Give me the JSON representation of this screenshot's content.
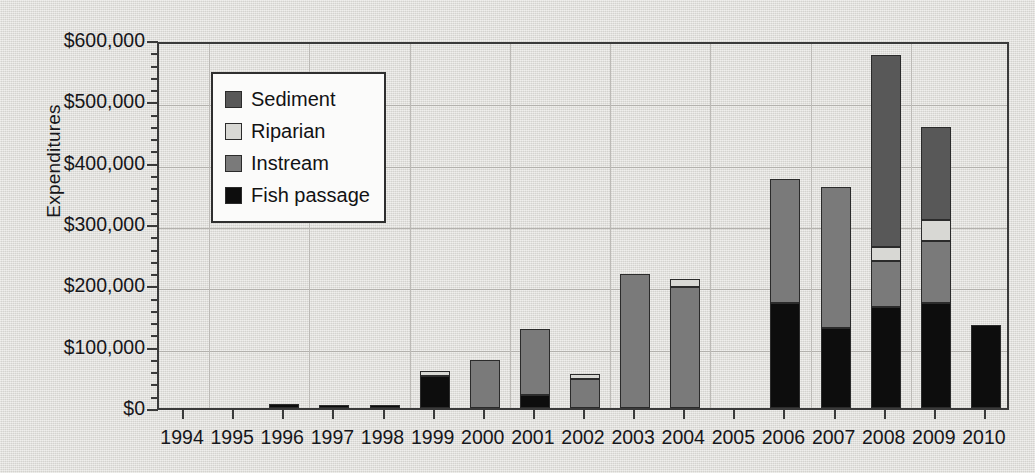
{
  "chart_data": {
    "type": "bar",
    "subtype": "stacked-vertical",
    "title": "",
    "xlabel": "",
    "ylabel": "Expenditures",
    "ylim": [
      0,
      600000
    ],
    "ytick_values": [
      0,
      100000,
      200000,
      300000,
      400000,
      500000,
      600000
    ],
    "ytick_labels": [
      "$0",
      "$100,000",
      "$200,000",
      "$300,000",
      "$400,000",
      "$500,000",
      "$600,000"
    ],
    "yminor_step": 20000,
    "grid": "horizontal-and-vertical",
    "legend_position": "upper-left-inside",
    "categories": [
      "1994",
      "1995",
      "1996",
      "1997",
      "1998",
      "1999",
      "2000",
      "2001",
      "2002",
      "2003",
      "2004",
      "2005",
      "2006",
      "2007",
      "2008",
      "2009",
      "2010"
    ],
    "series": [
      {
        "name": "Fish passage",
        "color": "#0d0d0d",
        "values": [
          0,
          0,
          6000,
          4000,
          4000,
          53000,
          0,
          22000,
          0,
          0,
          0,
          0,
          172000,
          131000,
          164000,
          172000,
          135000
        ]
      },
      {
        "name": "Instream",
        "color": "#7a7a7a",
        "values": [
          0,
          0,
          0,
          0,
          0,
          0,
          79000,
          107000,
          47000,
          219000,
          198000,
          0,
          201000,
          230000,
          75000,
          100000,
          0
        ]
      },
      {
        "name": "Riparian",
        "color": "#d8d8d4",
        "values": [
          0,
          0,
          0,
          0,
          0,
          8000,
          0,
          0,
          8000,
          0,
          13000,
          0,
          0,
          0,
          24000,
          35000,
          0
        ]
      },
      {
        "name": "Sediment",
        "color": "#585858",
        "values": [
          0,
          0,
          0,
          0,
          0,
          0,
          0,
          0,
          0,
          0,
          0,
          0,
          0,
          0,
          312000,
          151000,
          0
        ]
      }
    ],
    "stack_order_bottom_to_top": [
      "Fish passage",
      "Instream",
      "Riparian",
      "Sediment"
    ],
    "totals": [
      0,
      0,
      6000,
      4000,
      4000,
      61000,
      79000,
      129000,
      55000,
      219000,
      211000,
      0,
      373000,
      361000,
      575000,
      458000,
      135000
    ]
  },
  "legend": {
    "items": [
      {
        "label": "Sediment",
        "color": "#585858"
      },
      {
        "label": "Riparian",
        "color": "#d8d8d4"
      },
      {
        "label": "Instream",
        "color": "#7a7a7a"
      },
      {
        "label": "Fish passage",
        "color": "#0d0d0d"
      }
    ]
  }
}
